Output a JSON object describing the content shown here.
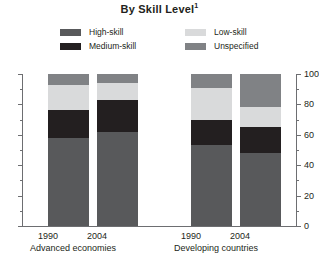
{
  "title": {
    "text": "By Skill Level",
    "footnote_marker": "1"
  },
  "legend": {
    "items": [
      {
        "label": "High-skill",
        "color": "#58595b",
        "swatch_name": "legend-swatch-high-skill"
      },
      {
        "label": "Medium-skill",
        "color": "#231f20",
        "swatch_name": "legend-swatch-medium-skill"
      },
      {
        "label": "Low-skill",
        "color": "#d9dadb",
        "swatch_name": "legend-swatch-low-skill"
      },
      {
        "label": "Unspecified",
        "color": "#808285",
        "swatch_name": "legend-swatch-unspecified"
      }
    ]
  },
  "axis": {
    "y_ticks_major": [
      "100",
      "80",
      "60",
      "40",
      "20",
      "0"
    ],
    "y_min": 0,
    "y_max": 100,
    "y_major_step": 20,
    "y_minor_step": 10
  },
  "groups": [
    {
      "label": "Advanced economies",
      "years": [
        "1990",
        "2004"
      ]
    },
    {
      "label": "Developing countries",
      "years": [
        "1990",
        "2004"
      ]
    }
  ],
  "chart_data": {
    "type": "bar",
    "subtype": "stacked-100-percent",
    "title": "By Skill Level",
    "xlabel": "",
    "ylabel": "",
    "ylim": [
      0,
      100
    ],
    "y_ticks": [
      0,
      20,
      40,
      60,
      80,
      100
    ],
    "y_minor_ticks": [
      10,
      30,
      50,
      70,
      90
    ],
    "grid": false,
    "legend_position": "top",
    "categories": [
      "1990",
      "2004",
      "1990",
      "2004"
    ],
    "category_groups": [
      "Advanced economies",
      "Advanced economies",
      "Developing countries",
      "Developing countries"
    ],
    "series": [
      {
        "name": "High-skill",
        "color": "#58595b",
        "values": [
          58,
          62,
          53,
          48
        ]
      },
      {
        "name": "Medium-skill",
        "color": "#231f20",
        "values": [
          18,
          21,
          17,
          17
        ]
      },
      {
        "name": "Low-skill",
        "color": "#d9dadb",
        "values": [
          17,
          11,
          21,
          13
        ]
      },
      {
        "name": "Unspecified",
        "color": "#808285",
        "values": [
          7,
          6,
          9,
          22
        ]
      }
    ]
  },
  "bars": [
    {
      "year": "1990",
      "group": "Advanced economies",
      "segments": [
        {
          "name": "Unspecified",
          "value": 7,
          "color": "#808285"
        },
        {
          "name": "Low-skill",
          "value": 17,
          "color": "#d9dadb"
        },
        {
          "name": "Medium-skill",
          "value": 18,
          "color": "#231f20"
        },
        {
          "name": "High-skill",
          "value": 58,
          "color": "#58595b"
        }
      ]
    },
    {
      "year": "2004",
      "group": "Advanced economies",
      "segments": [
        {
          "name": "Unspecified",
          "value": 6,
          "color": "#808285"
        },
        {
          "name": "Low-skill",
          "value": 11,
          "color": "#d9dadb"
        },
        {
          "name": "Medium-skill",
          "value": 21,
          "color": "#231f20"
        },
        {
          "name": "High-skill",
          "value": 62,
          "color": "#58595b"
        }
      ]
    },
    {
      "year": "1990",
      "group": "Developing countries",
      "segments": [
        {
          "name": "Unspecified",
          "value": 9,
          "color": "#808285"
        },
        {
          "name": "Low-skill",
          "value": 21,
          "color": "#d9dadb"
        },
        {
          "name": "Medium-skill",
          "value": 17,
          "color": "#231f20"
        },
        {
          "name": "High-skill",
          "value": 53,
          "color": "#58595b"
        }
      ]
    },
    {
      "year": "2004",
      "group": "Developing countries",
      "segments": [
        {
          "name": "Unspecified",
          "value": 22,
          "color": "#808285"
        },
        {
          "name": "Low-skill",
          "value": 13,
          "color": "#d9dadb"
        },
        {
          "name": "Medium-skill",
          "value": 17,
          "color": "#231f20"
        },
        {
          "name": "High-skill",
          "value": 48,
          "color": "#58595b"
        }
      ]
    }
  ]
}
